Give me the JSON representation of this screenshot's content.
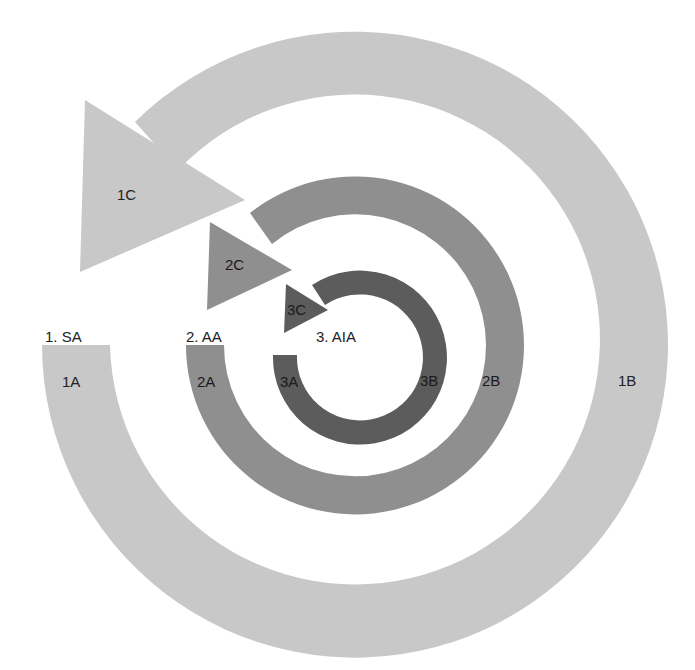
{
  "diagram": {
    "type": "nested-circular-arrows",
    "colors": {
      "ring1": "#c8c8c8",
      "ring2": "#8f8f8f",
      "ring3": "#5c5c5c",
      "text": "#222222",
      "background": "#ffffff"
    },
    "rings": [
      {
        "id": "1",
        "title": "1. SA",
        "segments": {
          "a": "1A",
          "b": "1B",
          "c": "1C"
        }
      },
      {
        "id": "2",
        "title": "2. AA",
        "segments": {
          "a": "2A",
          "b": "2B",
          "c": "2C"
        }
      },
      {
        "id": "3",
        "title": "3. AIA",
        "segments": {
          "a": "3A",
          "b": "3B",
          "c": "3C"
        }
      }
    ]
  }
}
